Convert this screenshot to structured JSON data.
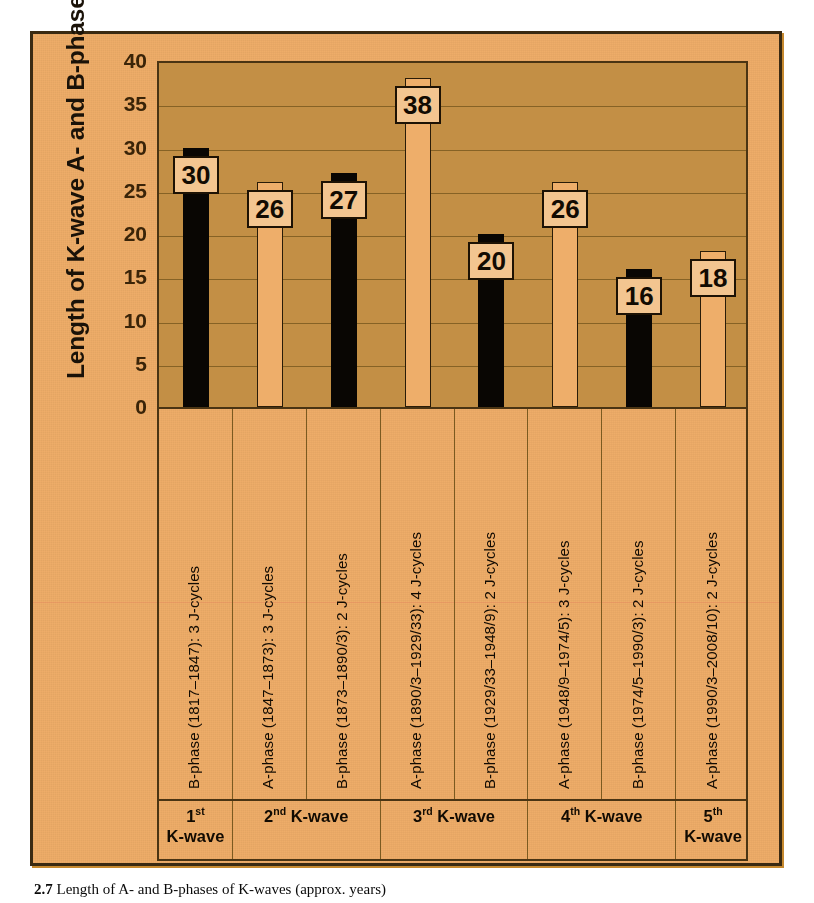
{
  "figure": {
    "y_axis_title": "Length of K-wave A- and B-phases  (years)",
    "caption_number": "2.7",
    "caption_text": "Length of A- and B-phases of K-waves (approx. years)"
  },
  "colors": {
    "panel_background": "#eeae6a",
    "plot_background": "#c38f45",
    "panel_border": "#3a2a12",
    "gridline": "#7b5a20",
    "bar_dark": "#090603",
    "bar_light": "#eeae6a",
    "value_box_fill": "#f3c590",
    "text": "#120b02"
  },
  "chart_data": {
    "type": "bar",
    "title": "",
    "xlabel": "",
    "ylabel": "Length of K-wave A- and B-phases  (years)",
    "ylim": [
      0,
      40
    ],
    "yticks": [
      0,
      5,
      10,
      15,
      20,
      25,
      30,
      35,
      40
    ],
    "ytick_labels": [
      "0",
      "5",
      "10",
      "15",
      "20",
      "25",
      "30",
      "35",
      "40"
    ],
    "grid": true,
    "legend": "none",
    "categories": [
      "B-phase (1817–1847): 3 J-cycles",
      "A-phase (1847–1873): 3 J-cycles",
      "B-phase (1873–1890/3): 2 J-cycles",
      "A-phase (1890/3–1929/33): 4 J-cycles",
      "B-phase (1929/33–1948/9): 2 J-cycles",
      "A-phase (1948/9–1974/5): 3 J-cycles",
      "B-phase (1974/5–1990/3): 2 J-cycles",
      "A-phase (1990/3–2008/10): 2 J-cycles"
    ],
    "values": [
      30,
      26,
      27,
      38,
      20,
      26,
      16,
      18
    ],
    "phase_types": [
      "B",
      "A",
      "B",
      "A",
      "B",
      "A",
      "B",
      "A"
    ],
    "bar_styles": [
      "dark",
      "light",
      "dark",
      "light",
      "dark",
      "light",
      "dark",
      "light"
    ],
    "value_labels": [
      "30",
      "26",
      "27",
      "38",
      "20",
      "26",
      "16",
      "18"
    ]
  },
  "bars": [
    {
      "label": "B-phase (1817–1847): 3 J-cycles",
      "value": 30,
      "value_label": "30",
      "style": "dark",
      "phase": "B"
    },
    {
      "label": "A-phase (1847–1873): 3 J-cycles",
      "value": 26,
      "value_label": "26",
      "style": "light",
      "phase": "A"
    },
    {
      "label": "B-phase (1873–1890/3): 2 J-cycles",
      "value": 27,
      "value_label": "27",
      "style": "dark",
      "phase": "B"
    },
    {
      "label": "A-phase (1890/3–1929/33): 4 J-cycles",
      "value": 38,
      "value_label": "38",
      "style": "light",
      "phase": "A"
    },
    {
      "label": "B-phase (1929/33–1948/9): 2 J-cycles",
      "value": 20,
      "value_label": "20",
      "style": "dark",
      "phase": "B"
    },
    {
      "label": "A-phase (1948/9–1974/5): 3 J-cycles",
      "value": 26,
      "value_label": "26",
      "style": "light",
      "phase": "A"
    },
    {
      "label": "B-phase (1974/5–1990/3): 2 J-cycles",
      "value": 16,
      "value_label": "16",
      "style": "dark",
      "phase": "B"
    },
    {
      "label": "A-phase (1990/3–2008/10): 2 J-cycles",
      "value": 18,
      "value_label": "18",
      "style": "light",
      "phase": "A"
    }
  ],
  "groups": [
    {
      "ordinal": "1",
      "suffix": "st",
      "name": "K-wave",
      "two_lines": true,
      "span": 1
    },
    {
      "ordinal": "2",
      "suffix": "nd",
      "name": "K-wave",
      "two_lines": false,
      "span": 2
    },
    {
      "ordinal": "3",
      "suffix": "rd",
      "name": "K-wave",
      "two_lines": false,
      "span": 2
    },
    {
      "ordinal": "4",
      "suffix": "th",
      "name": "K-wave",
      "two_lines": false,
      "span": 2
    },
    {
      "ordinal": "5",
      "suffix": "th",
      "name": "K-wave",
      "two_lines": true,
      "span": 1
    }
  ]
}
